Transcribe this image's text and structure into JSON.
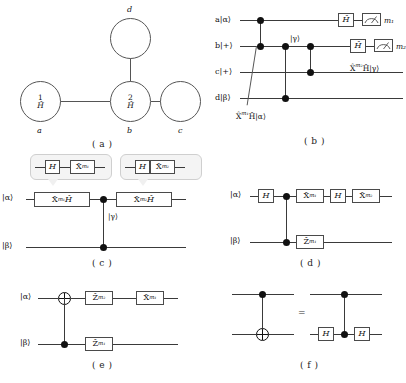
{
  "figure": {
    "caption_labels": {
      "a": "( a )",
      "b": "( b )",
      "c": "( c )",
      "d": "( d )",
      "e": "( e )",
      "f": "( f )"
    },
    "colors": {
      "wire": "#3a3a3a",
      "node_border": "#555555",
      "gate_border": "#4a4a4a",
      "bubble_fill": "#f4f4f4",
      "bubble_border": "#cfcfcf",
      "background": "#ffffff"
    }
  },
  "panel_a": {
    "title": "graph-state-cluster",
    "nodes": [
      {
        "id": "a",
        "number": "1",
        "operator": "Ĥ",
        "label": "a"
      },
      {
        "id": "b",
        "number": "2",
        "operator": "Ĥ",
        "label": "b"
      },
      {
        "id": "c",
        "number": "",
        "operator": "",
        "label": "c"
      },
      {
        "id": "d",
        "number": "",
        "operator": "",
        "label": "d"
      }
    ],
    "top_label": "d",
    "edges": [
      [
        "a",
        "b"
      ],
      [
        "b",
        "c"
      ],
      [
        "b",
        "d"
      ]
    ]
  },
  "panel_b": {
    "rails": [
      {
        "label": "a|α⟩"
      },
      {
        "label": "b|+⟩"
      },
      {
        "label": "c|+⟩"
      },
      {
        "label": "d|β⟩"
      }
    ],
    "gates": {
      "h1": "Ĥ",
      "h2": "Ĥ"
    },
    "measurements": [
      {
        "result": "m₁"
      },
      {
        "result": "m₂"
      }
    ],
    "annotations": {
      "gamma": "|γ⟩",
      "out_c": "X̂",
      "out_c_sup": "m₂",
      "out_c_tail": "Ĥ|γ⟩",
      "callout": "X̂",
      "callout_sup": "m₁",
      "callout_tail": "Ĥ|α⟩"
    }
  },
  "panel_c": {
    "rails": [
      {
        "label": "|α⟩"
      },
      {
        "label": "|β⟩"
      }
    ],
    "bubbles": [
      {
        "gate1": "H",
        "gate2": "X̂",
        "gate2_sup": "m₁"
      },
      {
        "gate1": "H",
        "gate2": "X̂",
        "gate2_sup": "m₂"
      }
    ],
    "main_gates": [
      {
        "base": "X̂",
        "sup": "m₁",
        "tail": "Ĥ"
      },
      {
        "base": "X̂",
        "sup": "m₂",
        "tail": "Ĥ"
      }
    ],
    "annotations": {
      "gamma": "|γ⟩"
    }
  },
  "panel_d": {
    "rails": [
      {
        "label": "|α⟩"
      },
      {
        "label": "|β⟩"
      }
    ],
    "top_gates": [
      {
        "base": "H",
        "sup": ""
      },
      {
        "base": "X̂",
        "sup": "m₁"
      },
      {
        "base": "H",
        "sup": ""
      },
      {
        "base": "X̂",
        "sup": "m₂"
      }
    ],
    "bottom_gates": [
      {
        "base": "Ẑ",
        "sup": "m₁"
      }
    ]
  },
  "panel_e": {
    "rails": [
      {
        "label": "|α⟩"
      },
      {
        "label": "|β⟩"
      }
    ],
    "top_gates": [
      {
        "base": "Ẑ",
        "sup": "m₂"
      },
      {
        "base": "X̂",
        "sup": "m₁"
      }
    ],
    "bottom_gates": [
      {
        "base": "Ẑ",
        "sup": "m₁"
      }
    ]
  },
  "panel_f": {
    "equals": "=",
    "left": {
      "target_icon": "xor-target-icon",
      "control_icon": "control-dot-icon"
    },
    "right": {
      "gate1": "H",
      "gate2": "H",
      "control_icon": "control-dot-icon"
    }
  }
}
